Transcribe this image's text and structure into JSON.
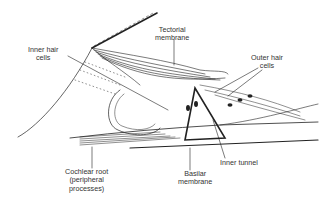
{
  "diagram": {
    "labels": {
      "inner_hair_cells": [
        "Inner hair",
        "cells"
      ],
      "tectorial_membrane": [
        "Tectorial",
        "membrane"
      ],
      "outer_hair_cells": [
        "Outer hair",
        "cells"
      ],
      "cochlear_root": [
        "Cochlear root",
        "(peripheral",
        "processes)"
      ],
      "basilar_membrane": [
        "Basilar",
        "membrane"
      ],
      "inner_tunnel": [
        "Inner tunnel"
      ]
    },
    "colors": {
      "line": "#222222",
      "text": "#333333",
      "background": "#ffffff"
    }
  }
}
